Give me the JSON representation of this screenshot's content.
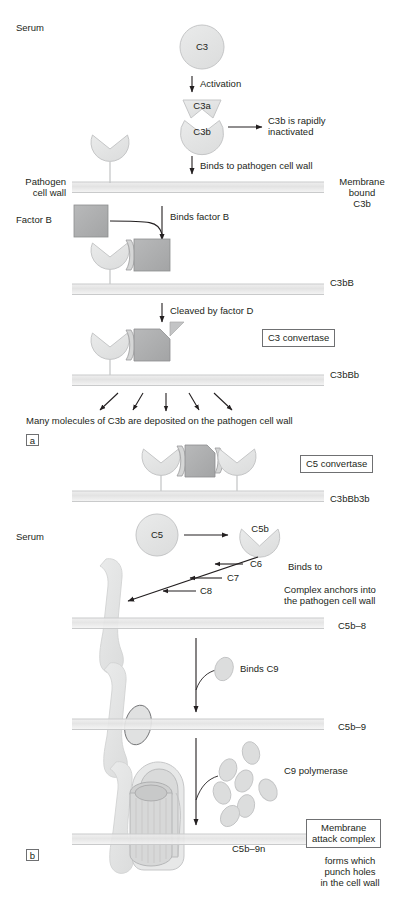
{
  "figure": {
    "panels": [
      "a",
      "b"
    ]
  },
  "colors": {
    "protein_fill": "#e2e3e3",
    "protein_stroke": "#b9babb",
    "factorB_fill": "#b0b1b2",
    "factorB_stroke": "#8d8e8f",
    "membrane_fill": "#e6e6e6",
    "membrane_line": "#c9cacb",
    "text": "#231f20",
    "arrow": "#231f20",
    "box_border": "#6f7072"
  },
  "panel_a": {
    "serum_label": "Serum",
    "pathogen_label": "Pathogen\ncell wall",
    "factor_b_label": "Factor B",
    "molecules": {
      "c3": "C3",
      "c3a": "C3a",
      "c3b": "C3b"
    },
    "steps": {
      "activation": "Activation",
      "inactivated": "C3b is rapidly\ninactivated",
      "binds_wall": "Binds to pathogen cell wall",
      "binds_factor_b": "Binds factor B",
      "cleaved_factor_d": "Cleaved by factor D"
    },
    "right_labels": {
      "membrane_bound_c3b": "Membrane\nbound\nC3b",
      "c3bB": "C3bB",
      "c3bBb": "C3bBb"
    },
    "boxes": {
      "c3_convertase": "C3 convertase"
    },
    "summary": "Many molecules of C3b are deposited on the pathogen cell wall",
    "panel_letter": "a"
  },
  "panel_b": {
    "serum_label": "Serum",
    "boxes": {
      "c5_convertase": "C5 convertase",
      "membrane_attack_complex": "Membrane\nattack complex"
    },
    "molecules": {
      "c5": "C5",
      "c5b": "C5b",
      "c6": "C6",
      "c7": "C7",
      "c8": "C8"
    },
    "steps": {
      "binds_to": "Binds to",
      "complex_anchors": "Complex anchors into\nthe pathogen cell wall",
      "binds_c9": "Binds C9",
      "c9_polymerase": "C9 polymerase",
      "mac_effect": "forms which\npunch holes\nin the cell wall"
    },
    "right_labels": {
      "c3bBb3b": "C3bBb3b",
      "c5b_8": "C5b–8",
      "c5b_9": "C5b–9",
      "c5b_9n": "C5b–9n"
    },
    "panel_letter": "b"
  }
}
